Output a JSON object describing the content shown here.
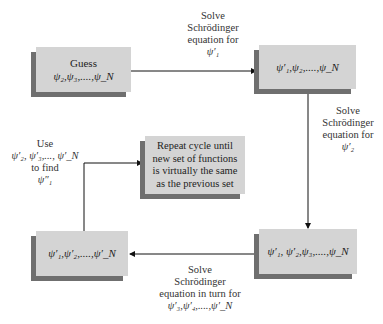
{
  "boxes": {
    "guess": {
      "title": "Guess",
      "formula": "ψ₂,ψ₃,....,ψ_N"
    },
    "top_right": {
      "formula": "ψ′₁,ψ₂,....,ψ_N"
    },
    "repeat": {
      "lines": [
        "Repeat cycle until",
        "new set of functions",
        "is virtually the same",
        "as the previous set"
      ]
    },
    "bottom_right": {
      "formula": "ψ′₁, ψ′₂,ψ₃,....,ψ_N"
    },
    "bottom_left": {
      "formula": "ψ′₁,ψ′₂,....,ψ′_N"
    }
  },
  "labels": {
    "top": {
      "lines": [
        "Solve",
        "Schrödinger",
        "equation for",
        "ψ′₁"
      ]
    },
    "right": {
      "lines": [
        "Solve",
        "Schrödinger",
        "equation for",
        "ψ′₂"
      ]
    },
    "bottom": {
      "lines": [
        "Solve",
        "Schrödinger",
        "equation in turn for",
        "ψ′₃,ψ′₄,....,ψ′_N"
      ]
    },
    "left": {
      "lines": [
        "Use",
        "ψ′₂, ψ′₃,..., ψ′_N",
        "to find",
        "ψ″₁"
      ]
    }
  }
}
